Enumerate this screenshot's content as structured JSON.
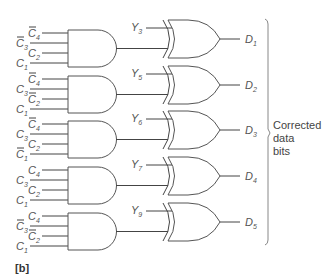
{
  "figure": {
    "caption": "[b]",
    "side_label_lines": [
      "Corrected",
      "data",
      "bits"
    ]
  },
  "and_gates": [
    {
      "inputs": [
        {
          "name": "C",
          "sub": "4",
          "bar": true
        },
        {
          "name": "C",
          "sub": "3",
          "bar": true
        },
        {
          "name": "C",
          "sub": "2",
          "bar": false
        },
        {
          "name": "C",
          "sub": "1",
          "bar": false
        }
      ]
    },
    {
      "inputs": [
        {
          "name": "C",
          "sub": "4",
          "bar": true
        },
        {
          "name": "C",
          "sub": "3",
          "bar": false
        },
        {
          "name": "C",
          "sub": "2",
          "bar": true
        },
        {
          "name": "C",
          "sub": "1",
          "bar": false
        }
      ]
    },
    {
      "inputs": [
        {
          "name": "C",
          "sub": "4",
          "bar": true
        },
        {
          "name": "C",
          "sub": "3",
          "bar": false
        },
        {
          "name": "C",
          "sub": "2",
          "bar": false
        },
        {
          "name": "C",
          "sub": "1",
          "bar": true
        }
      ]
    },
    {
      "inputs": [
        {
          "name": "C",
          "sub": "4",
          "bar": false
        },
        {
          "name": "C",
          "sub": "3",
          "bar": false
        },
        {
          "name": "C",
          "sub": "2",
          "bar": false
        },
        {
          "name": "C",
          "sub": "1",
          "bar": false
        }
      ]
    },
    {
      "inputs": [
        {
          "name": "C",
          "sub": "4",
          "bar": false
        },
        {
          "name": "C",
          "sub": "3",
          "bar": true
        },
        {
          "name": "C",
          "sub": "2",
          "bar": true
        },
        {
          "name": "C",
          "sub": "1",
          "bar": false
        }
      ]
    }
  ],
  "xor_gates": [
    {
      "y_input": {
        "name": "Y",
        "sub": "3"
      },
      "output": {
        "name": "D",
        "sub": "1"
      }
    },
    {
      "y_input": {
        "name": "Y",
        "sub": "5"
      },
      "output": {
        "name": "D",
        "sub": "2"
      }
    },
    {
      "y_input": {
        "name": "Y",
        "sub": "6"
      },
      "output": {
        "name": "D",
        "sub": "3"
      }
    },
    {
      "y_input": {
        "name": "Y",
        "sub": "7"
      },
      "output": {
        "name": "D",
        "sub": "4"
      }
    },
    {
      "y_input": {
        "name": "Y",
        "sub": "9"
      },
      "output": {
        "name": "D",
        "sub": "5"
      }
    }
  ]
}
